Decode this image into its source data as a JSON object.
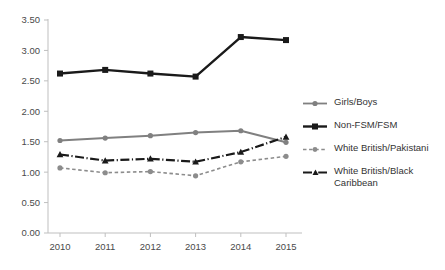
{
  "chart_data": {
    "type": "line",
    "title": "",
    "xlabel": "",
    "ylabel": "",
    "categories": [
      "2010",
      "2011",
      "2012",
      "2013",
      "2014",
      "2015"
    ],
    "x": [
      2010,
      2011,
      2012,
      2013,
      2014,
      2015
    ],
    "ylim": [
      0.0,
      3.5
    ],
    "ytick_labels": [
      "0.00",
      "0.50",
      "1.00",
      "1.50",
      "2.00",
      "2.50",
      "3.00",
      "3.50"
    ],
    "ytick_values": [
      0.0,
      0.5,
      1.0,
      1.5,
      2.0,
      2.5,
      3.0,
      3.5
    ],
    "grid": false,
    "legend_position": "right",
    "series": [
      {
        "name": "Girls/Boys",
        "values": [
          1.52,
          1.56,
          1.6,
          1.65,
          1.68,
          1.49
        ],
        "color": "#808080",
        "line_style": "solid",
        "marker": "circle"
      },
      {
        "name": "Non-FSM/FSM",
        "values": [
          2.62,
          2.68,
          2.62,
          2.57,
          3.22,
          3.17
        ],
        "color": "#1a1a1a",
        "line_style": "solid",
        "marker": "square"
      },
      {
        "name": "White British/Pakistani",
        "values": [
          1.07,
          0.99,
          1.01,
          0.94,
          1.17,
          1.26
        ],
        "color": "#8c8c8c",
        "line_style": "dashed",
        "marker": "circle"
      },
      {
        "name": "White British/Black Caribbean",
        "values": [
          1.29,
          1.19,
          1.22,
          1.17,
          1.33,
          1.58
        ],
        "color": "#1a1a1a",
        "line_style": "dashdot",
        "marker": "triangle"
      }
    ]
  },
  "legend": {
    "items": [
      {
        "label": "Girls/Boys"
      },
      {
        "label": "Non-FSM/FSM"
      },
      {
        "label": "White British/Pakistani"
      },
      {
        "label": "White British/Black Caribbean"
      }
    ]
  },
  "axes": {
    "axis_color": "#bfbfbf",
    "tick_text_color": "#4a4a4a"
  }
}
